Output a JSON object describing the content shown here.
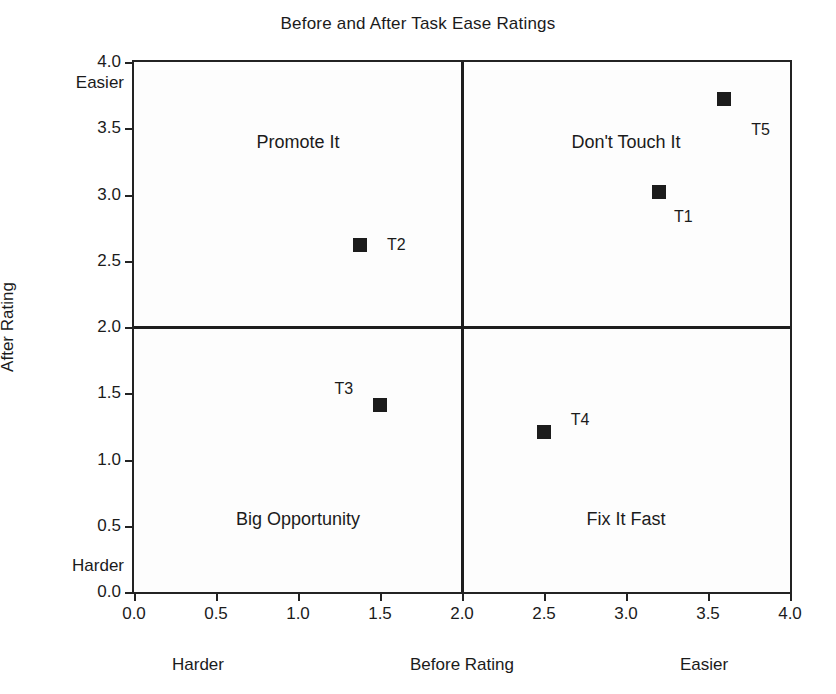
{
  "chart_data": {
    "type": "scatter",
    "title": "Before and After Task Ease Ratings",
    "xlabel": "Before Rating",
    "ylabel": "After Rating",
    "xlim": [
      0.0,
      4.0
    ],
    "ylim": [
      0.0,
      4.0
    ],
    "xticks": [
      "0.0",
      "0.5",
      "1.0",
      "1.5",
      "2.0",
      "2.5",
      "3.0",
      "3.5",
      "4.0"
    ],
    "yticks": [
      "0.0",
      "0.5",
      "1.0",
      "1.5",
      "2.0",
      "2.5",
      "3.0",
      "3.5",
      "4.0"
    ],
    "grid": false,
    "legend": "none",
    "axis_annotations": {
      "x_low": "Harder",
      "x_high": "Easier",
      "y_low": "Harder",
      "y_high": "Easier"
    },
    "reference_lines": {
      "vertical_x": 2.0,
      "horizontal_y": 2.0
    },
    "quadrants": [
      {
        "name": "top-left",
        "label": "Promote It",
        "cx": 1.0,
        "cy": 3.4
      },
      {
        "name": "top-right",
        "label": "Don't Touch It",
        "cx": 3.0,
        "cy": 3.4
      },
      {
        "name": "bottom-left",
        "label": "Big Opportunity",
        "cx": 1.0,
        "cy": 0.55
      },
      {
        "name": "bottom-right",
        "label": "Fix It Fast",
        "cx": 3.0,
        "cy": 0.55
      }
    ],
    "points": [
      {
        "label": "T1",
        "x": 3.2,
        "y": 3.02,
        "label_dx": 0.15,
        "label_dy": -0.19
      },
      {
        "label": "T2",
        "x": 1.38,
        "y": 2.62,
        "label_dx": 0.22,
        "label_dy": 0.0
      },
      {
        "label": "T3",
        "x": 1.5,
        "y": 1.41,
        "label_dx": -0.22,
        "label_dy": 0.12
      },
      {
        "label": "T4",
        "x": 2.5,
        "y": 1.21,
        "label_dx": 0.22,
        "label_dy": 0.09
      },
      {
        "label": "T5",
        "x": 3.6,
        "y": 3.72,
        "label_dx": 0.22,
        "label_dy": -0.23
      }
    ],
    "colors": {
      "marker": "#1c1c1c",
      "axis": "#232323",
      "reference_line": "#1d1d1d",
      "text": "#1b1b1b",
      "background": "#ffffff"
    }
  }
}
